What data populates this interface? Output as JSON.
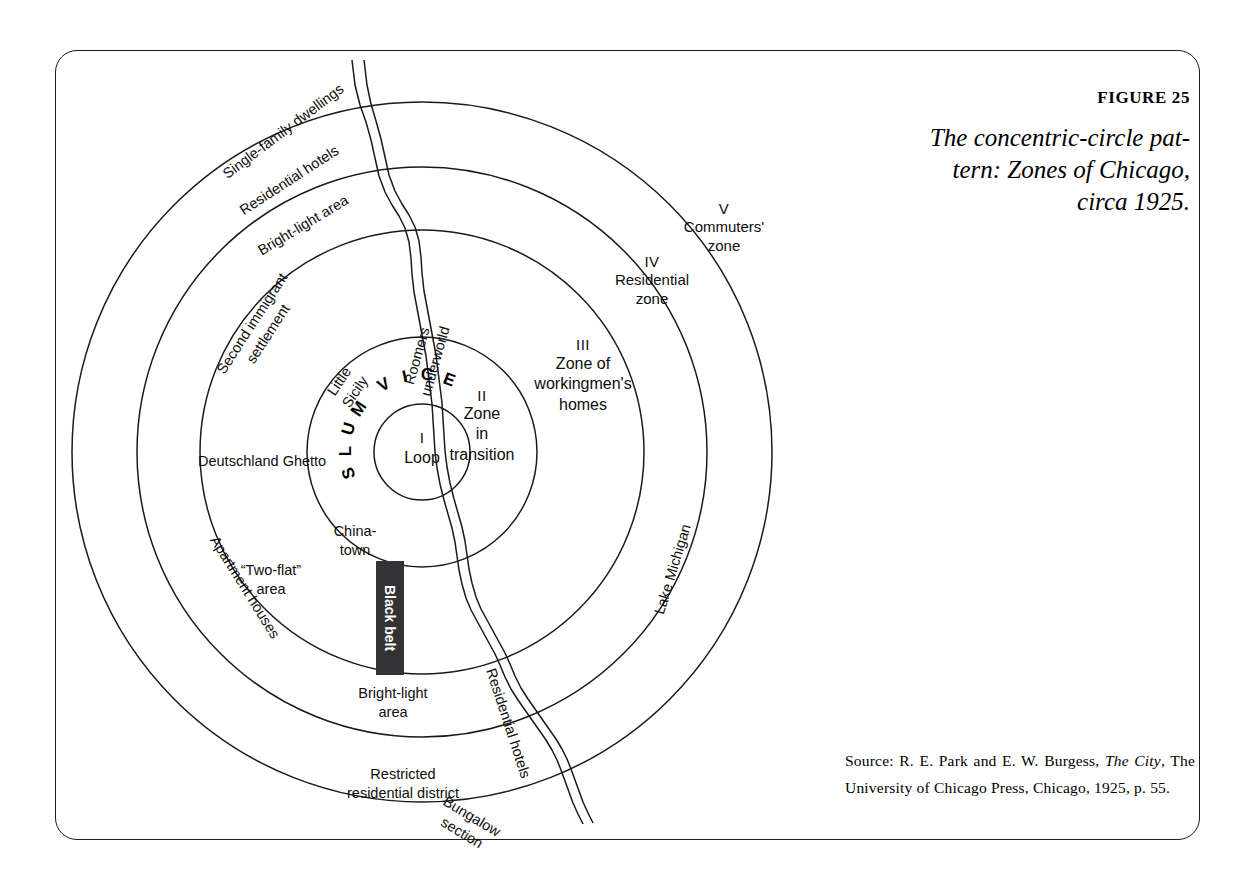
{
  "figure": {
    "number": "FIGURE 25",
    "title_line1": "The concentric-circle pat-",
    "title_line2": "tern: Zones of Chicago,",
    "title_line3": "circa 1925."
  },
  "source": {
    "prefix": "Source: R. E. Park and E. W. Burgess, ",
    "italic1": "The",
    "italic2": "City",
    "rest": ", The University of Chicago Press, Chicago, 1925, p. 55."
  },
  "zones": [
    {
      "roman": "I",
      "name": "Loop"
    },
    {
      "roman": "II",
      "name": "Zone\nin\ntransition"
    },
    {
      "roman": "III",
      "name": "Zone of\nworkingmen's\nhomes"
    },
    {
      "roman": "IV",
      "name": "Residential\nzone"
    },
    {
      "roman": "V",
      "name": "Commuters'\nzone"
    }
  ],
  "labels": {
    "single_family_dwellings": "Single-family dwellings",
    "residential_hotels_top": "Residential hotels",
    "bright_light_area_top": "Bright-light area",
    "second_immigrant_settlement": "Second immigrant\nsettlement",
    "deutschland_ghetto": "Deutschland Ghetto",
    "little_sicily": "Little\nSicily",
    "roomers_underworld": "Roomers\nunderworld",
    "chinatown": "China-\ntown",
    "two_flat_area": "“Two-flat”\narea",
    "apartment_houses": "Apartment houses",
    "black_belt": "Black belt",
    "bright_light_area_bottom": "Bright-light\narea",
    "restricted_residential_district": "Restricted\nresidential district",
    "bungalow_section": "Bungalow\nsection",
    "residential_hotels_bottom": "Residential hotels",
    "lake_michigan": "Lake Michigan",
    "slum": "SLUM",
    "vice": "VICE"
  },
  "chart_data": {
    "type": "diagram",
    "subtype": "concentric-zone-model",
    "center": {
      "x": 422,
      "y": 452
    },
    "rings": [
      {
        "roman": "I",
        "label": "Loop",
        "radius": 48
      },
      {
        "roman": "II",
        "label": "Zone in transition",
        "radius": 115
      },
      {
        "roman": "III",
        "label": "Zone of workingmen's homes",
        "radius": 222
      },
      {
        "roman": "IV",
        "label": "Residential zone",
        "radius": 285
      },
      {
        "roman": "V",
        "label": "Commuters' zone",
        "radius": 350
      }
    ],
    "features": [
      "Chicago River (wavy double line running north-south)",
      "Lake Michigan (east side)",
      "Black belt (dark vertical bar south of the Loop)",
      "SLUM / VICE arc around the Loop"
    ]
  },
  "colors": {
    "ink": "#000000",
    "line": "#1a1a1a",
    "black_belt_fill": "#333335",
    "paper": "#ffffff"
  }
}
